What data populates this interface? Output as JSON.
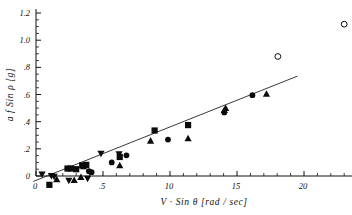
{
  "chart_data": {
    "type": "scatter",
    "title": "",
    "xlabel": "V · Sin θ  [rad / sec]",
    "ylabel": "a f  Sin ρ  [g]",
    "xlim": [
      -0.04,
      2.36
    ],
    "ylim": [
      -0.09,
      1.23
    ],
    "grid": false,
    "legend": "none",
    "xticks": [
      0,
      0.5,
      1.0,
      1.5,
      2.0
    ],
    "xticklabels": [
      "0",
      ".5",
      "10",
      "15",
      "20"
    ],
    "xtick_minor_step": 0.1,
    "yticks": [
      0,
      0.2,
      0.4,
      0.6,
      0.8,
      1.0,
      1.2
    ],
    "yticklabels": [
      "0",
      ".2",
      ".4",
      ".6",
      ".8",
      "1.0",
      "1.2"
    ],
    "ytick_minor_step": 0.05,
    "fit_line": {
      "label": "linear regression",
      "slope": 0.393,
      "intercept": -0.032,
      "x_start": -0.02,
      "x_end": 1.95,
      "y_start": -0.04,
      "y_end": 0.735
    },
    "series": [
      {
        "name": "squares",
        "marker": "square",
        "filled": true,
        "color": "#0b0b0b",
        "points": [
          [
            0.1,
            -0.065
          ],
          [
            0.235,
            0.055
          ],
          [
            0.26,
            0.055
          ],
          [
            0.3,
            0.05
          ],
          [
            0.345,
            0.078
          ],
          [
            0.355,
            0.072
          ],
          [
            0.375,
            0.082
          ],
          [
            0.625,
            0.14
          ],
          [
            0.885,
            0.335
          ],
          [
            1.135,
            0.375
          ]
        ]
      },
      {
        "name": "circles",
        "marker": "circle",
        "filled": true,
        "color": "#0b0b0b",
        "points": [
          [
            0.395,
            0.035
          ],
          [
            0.415,
            0.028
          ],
          [
            0.565,
            0.1
          ],
          [
            0.675,
            0.152
          ],
          [
            0.985,
            0.268
          ],
          [
            1.405,
            0.468
          ],
          [
            1.615,
            0.595
          ]
        ]
      },
      {
        "name": "up-triangles",
        "marker": "triangle-up",
        "filled": true,
        "color": "#0b0b0b",
        "points": [
          [
            0.155,
            -0.025
          ],
          [
            0.285,
            -0.03
          ],
          [
            0.335,
            -0.008
          ],
          [
            0.625,
            0.078
          ],
          [
            0.855,
            0.26
          ],
          [
            1.135,
            0.278
          ],
          [
            1.405,
            0.485
          ],
          [
            1.415,
            0.5
          ],
          [
            1.72,
            0.605
          ]
        ]
      },
      {
        "name": "down-triangles",
        "marker": "triangle-down",
        "filled": true,
        "color": "#0b0b0b",
        "points": [
          [
            0.045,
            0.012
          ],
          [
            0.115,
            0.0
          ],
          [
            0.135,
            -0.005
          ],
          [
            0.245,
            -0.035
          ],
          [
            0.385,
            -0.02
          ],
          [
            0.485,
            0.165
          ],
          [
            0.62,
            0.16
          ]
        ]
      },
      {
        "name": "open-circles",
        "marker": "circle",
        "filled": false,
        "color": "#0b0b0b",
        "points": [
          [
            1.805,
            0.88
          ],
          [
            2.3,
            1.118
          ]
        ]
      }
    ]
  }
}
